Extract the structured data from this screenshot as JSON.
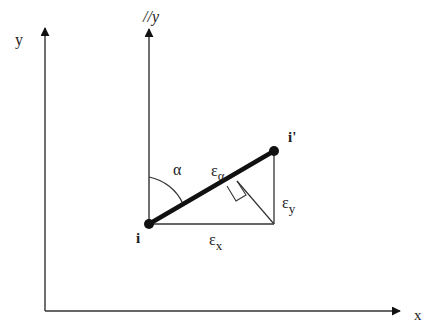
{
  "diagram": {
    "axes": {
      "x_label": "x",
      "y_label": "y",
      "parallel_y_label": "//y"
    },
    "points": {
      "start": "i",
      "end": "i'"
    },
    "labels": {
      "angle": "α",
      "epsilon_alpha": "ε",
      "epsilon_alpha_sub": "α",
      "epsilon_x": "ε",
      "epsilon_x_sub": "x",
      "epsilon_y": "ε",
      "epsilon_y_sub": "y"
    },
    "colors": {
      "stroke": "#222222",
      "background": "#ffffff"
    }
  }
}
